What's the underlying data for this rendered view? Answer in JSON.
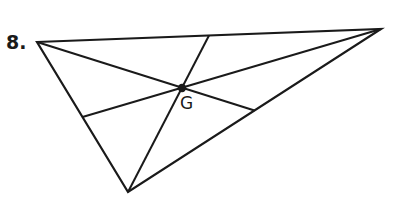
{
  "problem": {
    "number_label": "8."
  },
  "diagram": {
    "stroke_color": "#1a1a1a",
    "vertices": {
      "A": [
        37,
        42
      ],
      "B": [
        381,
        29
      ],
      "C": [
        128,
        192
      ]
    },
    "midpoints": {
      "AB": [
        209,
        35.5
      ],
      "BC": [
        254.5,
        110.5
      ],
      "AC": [
        82.5,
        117
      ]
    },
    "centroid": {
      "label": "G",
      "point": [
        182,
        88
      ]
    }
  }
}
